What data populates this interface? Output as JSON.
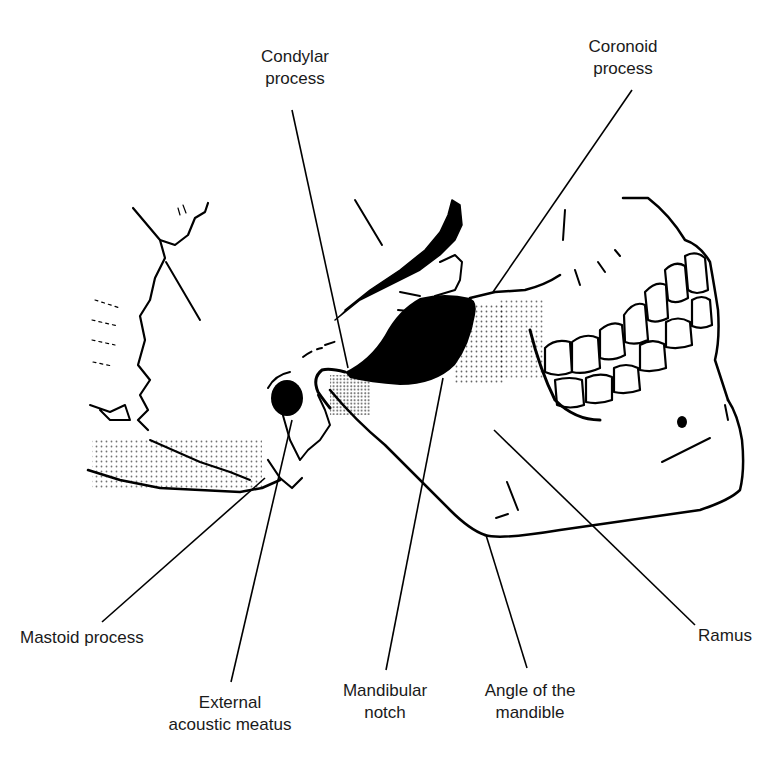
{
  "figure": {
    "ink_color": "#000000",
    "background_color": "#ffffff",
    "labels": [
      {
        "id": "condylar-process",
        "lines": [
          "Condylar",
          "process"
        ]
      },
      {
        "id": "coronoid-process",
        "lines": [
          "Coronoid",
          "process"
        ]
      },
      {
        "id": "mastoid-process",
        "lines": [
          "Mastoid process"
        ]
      },
      {
        "id": "external-acoustic-meatus",
        "lines": [
          "External",
          "acoustic meatus"
        ]
      },
      {
        "id": "mandibular-notch",
        "lines": [
          "Mandibular",
          "notch"
        ]
      },
      {
        "id": "angle-of-the-mandible",
        "lines": [
          "Angle of the",
          "mandible"
        ]
      },
      {
        "id": "ramus",
        "lines": [
          "Ramus"
        ]
      }
    ]
  }
}
